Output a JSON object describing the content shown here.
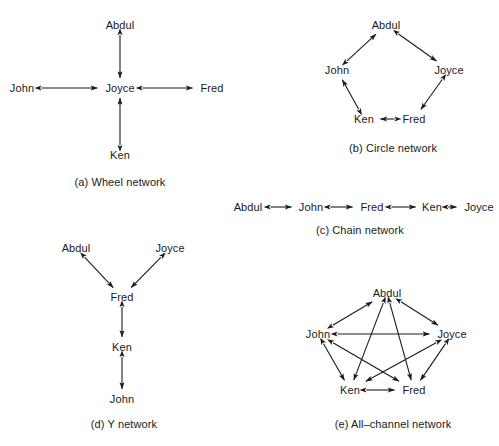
{
  "figure": {
    "stroke_color": "#1a1a1a",
    "text_color": "#1a1a1a",
    "background_color": "#ffffff"
  },
  "networks": [
    {
      "id": "wheel",
      "caption": "(a) Wheel network",
      "caption_x": 120,
      "caption_y": 176,
      "nodes": [
        {
          "name": "Abdul",
          "x": 120,
          "y": 25
        },
        {
          "name": "John",
          "x": 22,
          "y": 88
        },
        {
          "name": "Joyce",
          "x": 120,
          "y": 88
        },
        {
          "name": "Fred",
          "x": 212,
          "y": 88
        },
        {
          "name": "Ken",
          "x": 120,
          "y": 155
        }
      ],
      "edges": [
        {
          "from": "Abdul",
          "to": "Joyce"
        },
        {
          "from": "John",
          "to": "Joyce"
        },
        {
          "from": "Joyce",
          "to": "Fred"
        },
        {
          "from": "Ken",
          "to": "Joyce"
        }
      ]
    },
    {
      "id": "circle",
      "caption": "(b) Circle network",
      "caption_x": 393,
      "caption_y": 142,
      "nodes": [
        {
          "name": "Abdul",
          "x": 386,
          "y": 25
        },
        {
          "name": "John",
          "x": 337,
          "y": 70
        },
        {
          "name": "Joyce",
          "x": 449,
          "y": 70
        },
        {
          "name": "Ken",
          "x": 364,
          "y": 119
        },
        {
          "name": "Fred",
          "x": 414,
          "y": 119
        }
      ],
      "edges": [
        {
          "from": "John",
          "to": "Abdul"
        },
        {
          "from": "Abdul",
          "to": "Joyce"
        },
        {
          "from": "Joyce",
          "to": "Fred"
        },
        {
          "from": "Fred",
          "to": "Ken"
        },
        {
          "from": "Ken",
          "to": "John"
        }
      ]
    },
    {
      "id": "chain",
      "caption": "(c) Chain network",
      "caption_x": 360,
      "caption_y": 224,
      "nodes": [
        {
          "name": "Abdul",
          "x": 248,
          "y": 207
        },
        {
          "name": "John",
          "x": 311,
          "y": 207
        },
        {
          "name": "Fred",
          "x": 372,
          "y": 207
        },
        {
          "name": "Ken",
          "x": 432,
          "y": 207
        },
        {
          "name": "Joyce",
          "x": 479,
          "y": 207
        }
      ],
      "edges": [
        {
          "from": "Abdul",
          "to": "John"
        },
        {
          "from": "John",
          "to": "Fred"
        },
        {
          "from": "Fred",
          "to": "Ken"
        },
        {
          "from": "Ken",
          "to": "Joyce"
        }
      ]
    },
    {
      "id": "y",
      "caption": "(d) Y network",
      "caption_x": 124,
      "caption_y": 418,
      "nodes": [
        {
          "name": "Abdul",
          "x": 76,
          "y": 248
        },
        {
          "name": "Joyce",
          "x": 170,
          "y": 248
        },
        {
          "name": "Fred",
          "x": 122,
          "y": 297
        },
        {
          "name": "Ken",
          "x": 122,
          "y": 347
        },
        {
          "name": "John",
          "x": 122,
          "y": 399
        }
      ],
      "edges": [
        {
          "from": "Abdul",
          "to": "Fred"
        },
        {
          "from": "Joyce",
          "to": "Fred"
        },
        {
          "from": "Fred",
          "to": "Ken"
        },
        {
          "from": "Ken",
          "to": "John"
        }
      ]
    },
    {
      "id": "all-channel",
      "caption": "(e) All–channel network",
      "caption_x": 393,
      "caption_y": 418,
      "nodes": [
        {
          "name": "Abdul",
          "x": 387,
          "y": 293
        },
        {
          "name": "John",
          "x": 318,
          "y": 334
        },
        {
          "name": "Joyce",
          "x": 452,
          "y": 334
        },
        {
          "name": "Ken",
          "x": 350,
          "y": 390
        },
        {
          "name": "Fred",
          "x": 414,
          "y": 390
        }
      ],
      "edges": [
        {
          "from": "John",
          "to": "Abdul"
        },
        {
          "from": "Abdul",
          "to": "Joyce"
        },
        {
          "from": "John",
          "to": "Joyce"
        },
        {
          "from": "John",
          "to": "Ken"
        },
        {
          "from": "John",
          "to": "Fred"
        },
        {
          "from": "Joyce",
          "to": "Ken"
        },
        {
          "from": "Joyce",
          "to": "Fred"
        },
        {
          "from": "Abdul",
          "to": "Ken"
        },
        {
          "from": "Abdul",
          "to": "Fred"
        },
        {
          "from": "Ken",
          "to": "Fred"
        }
      ]
    }
  ]
}
